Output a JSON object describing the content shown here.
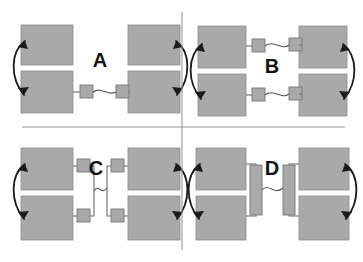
{
  "figure": {
    "title_present": false,
    "panel_count": 4,
    "background_color": "#ffffff",
    "block_color": "#a9a9a9",
    "linker_color": "#a9a9a9",
    "arrow_color": "#1b1b1b",
    "divider_color": "#9a9a9a",
    "dividers": {
      "vertical_x": 182,
      "vertical_y_start": 12,
      "vertical_y_end": 250,
      "horizontal_y": 127,
      "horizontal_x_start": 22,
      "horizontal_x_end": 345
    },
    "panels": [
      {
        "id": "A",
        "label": "A",
        "label_x": 100,
        "label_y": 62,
        "quadrant": "top-left",
        "connector_style": "single-linker-pair-bottom",
        "linker_shape": "small-square",
        "linker_count": 2,
        "arrow_count": 2,
        "block_count": 4
      },
      {
        "id": "B",
        "label": "B",
        "label_x": 272,
        "label_y": 68,
        "quadrant": "top-right",
        "connector_style": "double-linker-pair-top-and-bottom",
        "linker_shape": "small-square",
        "linker_count": 4,
        "arrow_count": 2,
        "block_count": 4
      },
      {
        "id": "C",
        "label": "C",
        "label_x": 96,
        "label_y": 170,
        "quadrant": "bottom-left",
        "connector_style": "four-linkers-joined-vertically",
        "linker_shape": "small-square",
        "linker_count": 4,
        "arrow_count": 2,
        "block_count": 4
      },
      {
        "id": "D",
        "label": "D",
        "label_x": 272,
        "label_y": 170,
        "quadrant": "bottom-right",
        "connector_style": "elongated-bar-linkers",
        "linker_shape": "tall-rectangle",
        "linker_count": 2,
        "arrow_count": 2,
        "block_count": 4
      }
    ]
  }
}
